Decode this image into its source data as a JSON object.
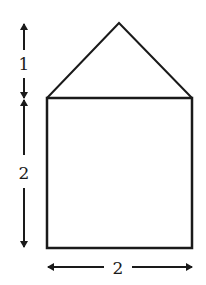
{
  "diagram": {
    "labels": {
      "roof_height": "1",
      "square_height": "2",
      "square_width": "2"
    },
    "colors": {
      "stroke": "#1a1a1a",
      "background": "#ffffff"
    }
  }
}
